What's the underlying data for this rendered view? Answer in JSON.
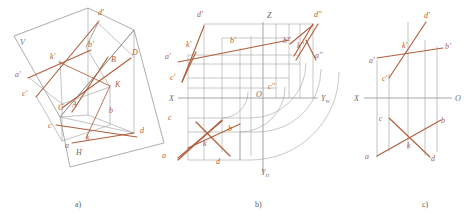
{
  "figure": {
    "colors": {
      "line_accent": "#b0603c",
      "line_gray": "#8a8a8a",
      "line_gray_dark": "#6d6d6d",
      "axis": "#909090",
      "label_accent": "#b0603c",
      "label_gray": "#6d6d6d",
      "background": "#ffffff"
    },
    "captions": [
      {
        "text": "a)",
        "x": 75,
        "y": 207
      },
      {
        "text": "b)",
        "x": 255,
        "y": 207
      },
      {
        "text": "c)",
        "x": 422,
        "y": 207
      }
    ]
  },
  "panel_a": {
    "name": "axonometric-pictorial-view",
    "plane_labels": [
      {
        "text": "V",
        "x": 20,
        "y": 45
      },
      {
        "text": "H",
        "x": 76,
        "y": 155
      }
    ],
    "point_labels": [
      {
        "text": "d'",
        "x": 98,
        "y": 15
      },
      {
        "text": "b'",
        "x": 88,
        "y": 47
      },
      {
        "text": "D",
        "x": 132,
        "y": 55
      },
      {
        "text": "B",
        "x": 111,
        "y": 62
      },
      {
        "text": "k'",
        "x": 50,
        "y": 59
      },
      {
        "text": "a'",
        "x": 15,
        "y": 77
      },
      {
        "text": "K",
        "x": 115,
        "y": 87
      },
      {
        "text": "c'",
        "x": 22,
        "y": 96
      },
      {
        "text": "C",
        "x": 58,
        "y": 110
      },
      {
        "text": "A",
        "x": 72,
        "y": 107
      },
      {
        "text": "b",
        "x": 109,
        "y": 113
      },
      {
        "text": "c",
        "x": 48,
        "y": 128
      },
      {
        "text": "d",
        "x": 140,
        "y": 133
      },
      {
        "text": "k",
        "x": 86,
        "y": 140
      },
      {
        "text": "a",
        "x": 65,
        "y": 148
      }
    ]
  },
  "panel_b": {
    "name": "three-view-projection",
    "axis_labels": [
      {
        "text": "Z",
        "x": 267,
        "y": 16
      },
      {
        "text": "X",
        "x": 170,
        "y": 101
      },
      {
        "text": "O",
        "x": 260,
        "y": 97
      },
      {
        "text": "Yw",
        "x": 322,
        "y": 101,
        "base": "Y",
        "sub": "W"
      },
      {
        "text": "YH",
        "x": 262,
        "y": 175,
        "base": "Y",
        "sub": "H"
      }
    ],
    "point_labels": [
      {
        "text": "d'",
        "x": 199,
        "y": 16
      },
      {
        "text": "d''",
        "x": 318,
        "y": 16
      },
      {
        "text": "b'",
        "x": 232,
        "y": 42
      },
      {
        "text": "b''",
        "x": 285,
        "y": 42
      },
      {
        "text": "k'",
        "x": 188,
        "y": 46
      },
      {
        "text": "k''",
        "x": 300,
        "y": 47
      },
      {
        "text": "a'",
        "x": 165,
        "y": 58
      },
      {
        "text": "a''",
        "x": 317,
        "y": 57
      },
      {
        "text": "c'",
        "x": 171,
        "y": 79
      },
      {
        "text": "c''",
        "x": 272,
        "y": 88
      },
      {
        "text": "c",
        "x": 169,
        "y": 119
      },
      {
        "text": "b",
        "x": 230,
        "y": 130
      },
      {
        "text": "k",
        "x": 205,
        "y": 145
      },
      {
        "text": "a",
        "x": 163,
        "y": 157
      },
      {
        "text": "d",
        "x": 218,
        "y": 163
      }
    ]
  },
  "panel_c": {
    "name": "two-view-projection",
    "axis_labels": [
      {
        "text": "X",
        "x": 355,
        "y": 101
      },
      {
        "text": "O",
        "x": 457,
        "y": 100
      }
    ],
    "point_labels": [
      {
        "text": "d'",
        "x": 426,
        "y": 17
      },
      {
        "text": "k'",
        "x": 404,
        "y": 47
      },
      {
        "text": "b'",
        "x": 447,
        "y": 48
      },
      {
        "text": "a'",
        "x": 371,
        "y": 62
      },
      {
        "text": "c'",
        "x": 384,
        "y": 80
      },
      {
        "text": "c",
        "x": 381,
        "y": 120
      },
      {
        "text": "b",
        "x": 443,
        "y": 122
      },
      {
        "text": "k",
        "x": 409,
        "y": 147
      },
      {
        "text": "a",
        "x": 367,
        "y": 158
      },
      {
        "text": "d",
        "x": 433,
        "y": 160
      }
    ]
  }
}
